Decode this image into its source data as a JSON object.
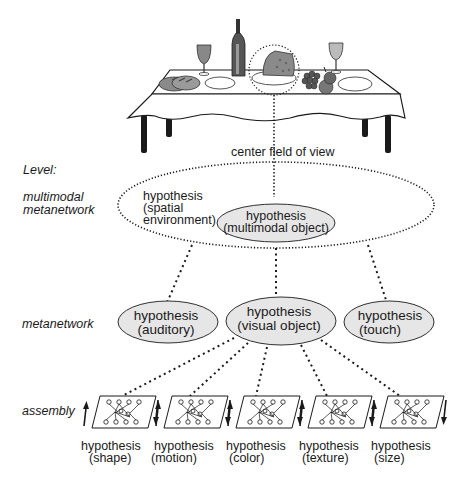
{
  "diagram": {
    "scene": {
      "description": "table with bread, wine glasses, wine bottle, cheese, grapes and plates",
      "items": [
        "bread",
        "wine-glass",
        "plate",
        "wine-bottle",
        "cheese",
        "grapes",
        "wine-glass",
        "plate"
      ],
      "focus_item": "cheese",
      "focus_label": "center field of view"
    },
    "levels": {
      "header": "Level:",
      "multimodal": [
        "multimodal",
        "metanetwork"
      ],
      "metanetwork": "metanetwork",
      "assembly": "assembly"
    },
    "multimodal_metanetwork": {
      "spatial": [
        "hypothesis",
        "(spatial",
        "environment)"
      ],
      "object": [
        "hypothesis",
        "(multimodal object)"
      ]
    },
    "metanetwork_nodes": [
      {
        "line1": "hypothesis",
        "line2": "(auditory)"
      },
      {
        "line1": "hypothesis",
        "line2": "(visual object)"
      },
      {
        "line1": "hypothesis",
        "line2": "(touch)"
      }
    ],
    "assembly_nodes": [
      {
        "line1": "hypothesis",
        "line2": "(shape)"
      },
      {
        "line1": "hypothesis",
        "line2": "(motion)"
      },
      {
        "line1": "hypothesis",
        "line2": "(color)"
      },
      {
        "line1": "hypothesis",
        "line2": "(texture)"
      },
      {
        "line1": "hypothesis",
        "line2": "(size)"
      }
    ],
    "colors": {
      "ink": "#1a1a1a",
      "node_fill": "#e6e6e6",
      "cloth": "#ffffff",
      "food_gray": "#8a8a8a"
    }
  }
}
